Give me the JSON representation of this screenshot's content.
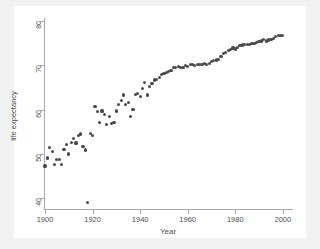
{
  "chart": {
    "type": "scatter",
    "title": "",
    "xlabel": "Year",
    "ylabel": "life expectancy",
    "marker_color": "#4a4a4a",
    "axis_color": "#a9a9a9",
    "plot_background": "#ffffff",
    "figure_background": "#f1f1f1",
    "grid": false,
    "legend": "none"
  },
  "axes": {
    "x": {
      "label": "Year",
      "ticks": [
        1900,
        1920,
        1940,
        1960,
        1980,
        2000
      ],
      "tick_labels": [
        "1900",
        "1920",
        "1940",
        "1960",
        "1980",
        "2000"
      ],
      "min": 1900,
      "max": 2003
    },
    "y": {
      "label": "life expectancy",
      "ticks": [
        40,
        50,
        60,
        70,
        80
      ],
      "tick_labels": [
        "40",
        "50",
        "60",
        "70",
        "80"
      ],
      "min": 37.6,
      "max": 80
    }
  },
  "chart_data": {
    "type": "scatter",
    "title": "",
    "xlabel": "Year",
    "ylabel": "life expectancy",
    "xlim": [
      1900,
      2003
    ],
    "ylim": [
      37.6,
      80
    ],
    "xticks": [
      1900,
      1920,
      1940,
      1960,
      1980,
      2000
    ],
    "yticks": [
      40,
      50,
      60,
      70,
      80
    ],
    "grid": false,
    "legend": "none",
    "marker": "filled-circle",
    "series": [
      {
        "name": "life expectancy",
        "color": "#4a4a4a",
        "x": [
          1900,
          1901,
          1902,
          1903,
          1904,
          1905,
          1906,
          1907,
          1908,
          1909,
          1910,
          1911,
          1912,
          1913,
          1914,
          1915,
          1916,
          1917,
          1918,
          1919,
          1920,
          1921,
          1922,
          1923,
          1924,
          1925,
          1926,
          1927,
          1928,
          1929,
          1930,
          1931,
          1932,
          1933,
          1934,
          1935,
          1936,
          1937,
          1938,
          1939,
          1940,
          1941,
          1942,
          1943,
          1944,
          1945,
          1946,
          1947,
          1948,
          1949,
          1950,
          1951,
          1952,
          1953,
          1954,
          1955,
          1956,
          1957,
          1958,
          1959,
          1960,
          1961,
          1962,
          1963,
          1964,
          1965,
          1966,
          1967,
          1968,
          1969,
          1970,
          1971,
          1972,
          1973,
          1974,
          1975,
          1976,
          1977,
          1978,
          1979,
          1980,
          1981,
          1982,
          1983,
          1984,
          1985,
          1986,
          1987,
          1988,
          1989,
          1990,
          1991,
          1992,
          1993,
          1994,
          1995,
          1996,
          1997,
          1998,
          1999,
          2000
        ],
        "y": [
          47.3,
          49.1,
          51.5,
          50.5,
          47.6,
          48.7,
          48.7,
          47.6,
          51.1,
          52.1,
          50.0,
          52.6,
          53.5,
          52.5,
          54.2,
          54.5,
          51.7,
          50.9,
          39.1,
          54.7,
          54.1,
          60.8,
          59.6,
          57.2,
          59.7,
          59.0,
          56.7,
          58.4,
          56.8,
          57.1,
          59.7,
          61.1,
          62.1,
          63.3,
          61.1,
          61.7,
          58.5,
          60.0,
          63.5,
          63.7,
          62.9,
          64.8,
          66.2,
          63.3,
          65.2,
          65.9,
          66.7,
          66.8,
          67.2,
          68.0,
          68.2,
          68.4,
          68.6,
          68.8,
          69.6,
          69.6,
          69.7,
          69.5,
          69.6,
          69.9,
          69.7,
          70.2,
          70.1,
          69.9,
          70.2,
          70.2,
          70.2,
          70.5,
          70.2,
          70.5,
          70.8,
          71.1,
          71.2,
          71.4,
          72.0,
          72.6,
          72.9,
          73.3,
          73.5,
          73.9,
          73.7,
          74.1,
          74.5,
          74.6,
          74.7,
          74.7,
          74.7,
          74.9,
          74.9,
          75.1,
          75.4,
          75.5,
          75.8,
          75.5,
          75.7,
          75.8,
          76.1,
          76.5,
          76.7,
          76.7,
          76.8
        ]
      }
    ],
    "annotations": [
      {
        "label": "1918 influenza pandemic low point",
        "x": 1918,
        "y": 39.1
      }
    ]
  }
}
